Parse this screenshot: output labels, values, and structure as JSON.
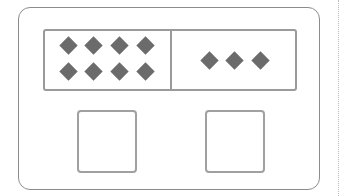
{
  "diagram": {
    "left_group": {
      "count": 8,
      "rows": 2,
      "cols": 4,
      "shape": "diamond"
    },
    "right_group": {
      "count": 3,
      "rows": 1,
      "cols": 3,
      "shape": "diamond"
    },
    "answer_boxes": [
      {
        "label": "",
        "value": ""
      },
      {
        "label": "",
        "value": ""
      }
    ],
    "colors": {
      "diamond": "#6b6b6b",
      "border": "#9a9a9a"
    }
  }
}
